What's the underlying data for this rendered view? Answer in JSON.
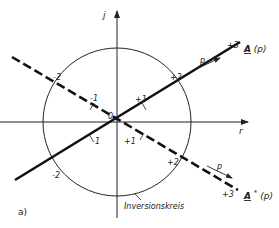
{
  "figure": {
    "panel_label": "a)",
    "axes": {
      "vertical_label": "j",
      "horizontal_label": "r"
    },
    "circle_label": "Inversionskreis",
    "origin_label": "0",
    "solid_line": {
      "name": "A(p)",
      "label_main": "A",
      "label_arg": "(p)",
      "direction_label": "p",
      "ticks": [
        "-2",
        "-1",
        "+1",
        "+2",
        "+3"
      ]
    },
    "dashed_line": {
      "name": "A*(p)",
      "label_main": "A",
      "label_sup": "*",
      "label_arg": "(p)",
      "direction_label": "p",
      "ticks": [
        "-2",
        "-1",
        "+1",
        "+2",
        "+3"
      ]
    },
    "colors": {
      "ink": "#222222",
      "background": "#ffffff"
    }
  }
}
